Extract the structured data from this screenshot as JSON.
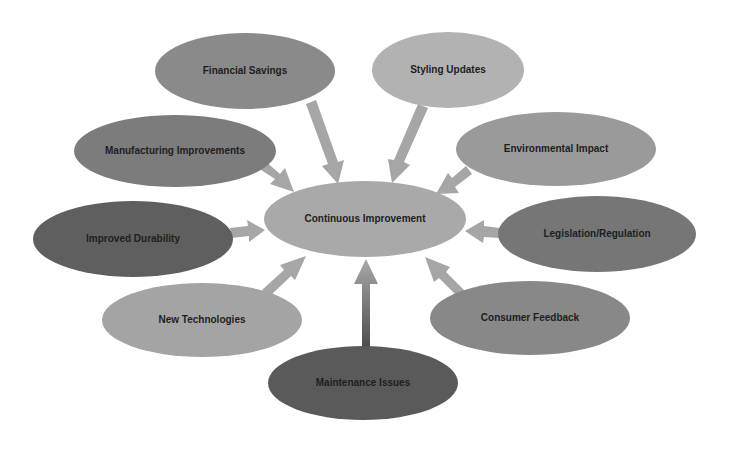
{
  "diagram": {
    "center": {
      "label": "Continuous Improvement",
      "cx": 365,
      "cy": 219,
      "rx": 101,
      "ry": 38,
      "color": "#a9a9a9"
    },
    "nodes": [
      {
        "id": "financial-savings",
        "label": "Financial Savings",
        "cx": 245,
        "cy": 71,
        "rx": 90,
        "ry": 38,
        "color": "#8a8a8a"
      },
      {
        "id": "styling-updates",
        "label": "Styling Updates",
        "cx": 448,
        "cy": 70,
        "rx": 76,
        "ry": 38,
        "color": "#b2b2b2"
      },
      {
        "id": "manufacturing-improvements",
        "label": "Manufacturing Improvements",
        "cx": 175,
        "cy": 151,
        "rx": 101,
        "ry": 36,
        "color": "#7c7c7c"
      },
      {
        "id": "environmental-impact",
        "label": "Environmental Impact",
        "cx": 556,
        "cy": 149,
        "rx": 100,
        "ry": 37,
        "color": "#9a9a9a"
      },
      {
        "id": "improved-durability",
        "label": "Improved Durability",
        "cx": 133,
        "cy": 239,
        "rx": 100,
        "ry": 38,
        "color": "#5f5f5f"
      },
      {
        "id": "legislation-regulation",
        "label": "Legislation/Regulation",
        "cx": 597,
        "cy": 234,
        "rx": 99,
        "ry": 38,
        "color": "#767676"
      },
      {
        "id": "new-technologies",
        "label": "New Technologies",
        "cx": 202,
        "cy": 320,
        "rx": 100,
        "ry": 37,
        "color": "#a4a4a4"
      },
      {
        "id": "consumer-feedback",
        "label": "Consumer Feedback",
        "cx": 530,
        "cy": 318,
        "rx": 100,
        "ry": 37,
        "color": "#888888"
      },
      {
        "id": "maintenance-issues",
        "label": "Maintenance Issues",
        "cx": 363,
        "cy": 383,
        "rx": 95,
        "ry": 37,
        "color": "#5a5a5a"
      }
    ],
    "arrow_color": "#a6a6a6"
  }
}
